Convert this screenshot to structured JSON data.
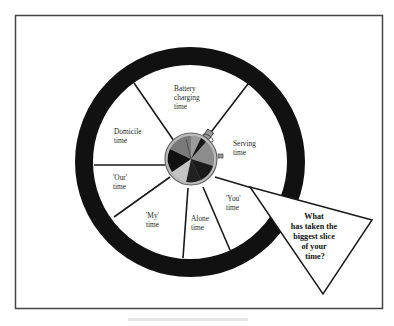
{
  "diagram": {
    "slices": [
      {
        "id": "battery",
        "lines": [
          "Battery",
          "charging",
          "time"
        ]
      },
      {
        "id": "serving",
        "lines": [
          "Serving",
          "time"
        ]
      },
      {
        "id": "you",
        "lines": [
          "'You'",
          "time"
        ]
      },
      {
        "id": "alone",
        "lines": [
          "Alone",
          "time"
        ]
      },
      {
        "id": "my",
        "lines": [
          "'My'",
          "time"
        ]
      },
      {
        "id": "our",
        "lines": [
          "'Our'",
          "time"
        ]
      },
      {
        "id": "domicile",
        "lines": [
          "Domicile",
          "time"
        ]
      }
    ],
    "question": {
      "lines": [
        "What",
        "has taken the",
        "biggest slice",
        "of your",
        "time?"
      ]
    },
    "center_icon": "stopwatch-pie-icon",
    "colors": {
      "ring": "#111111",
      "frame": "#444444",
      "dark_slice": "#151515",
      "mid_slice": "#777777",
      "light_slice": "#bdbdbd"
    }
  }
}
